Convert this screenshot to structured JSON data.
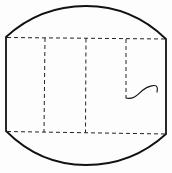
{
  "diagram": {
    "type": "net-outline",
    "colors": {
      "background": "#fdfdfd",
      "stroke": "#111111"
    },
    "outline": {
      "left_x": 6,
      "right_x": 166,
      "top_left_y": 37,
      "top_right_y": 39,
      "bottom_left_y": 131,
      "bottom_right_y": 134,
      "top_peak_y": 6,
      "bottom_peak_y": 165
    },
    "dashed_lines": {
      "horizontal": [
        {
          "name": "top-fold",
          "x1": 6,
          "y1": 37,
          "x2": 166,
          "y2": 39
        },
        {
          "name": "bottom-fold",
          "x1": 6,
          "y1": 131,
          "x2": 166,
          "y2": 134
        }
      ],
      "vertical": [
        {
          "name": "fold-1",
          "x": 45,
          "y1": 38,
          "y2": 132
        },
        {
          "name": "fold-2",
          "x": 86,
          "y1": 38,
          "y2": 132
        },
        {
          "name": "fold-3",
          "x": 126,
          "y1": 39,
          "y2": 98
        }
      ]
    },
    "curve": {
      "name": "wavy-line",
      "start": [
        126,
        98
      ],
      "end": [
        157,
        91
      ]
    }
  }
}
